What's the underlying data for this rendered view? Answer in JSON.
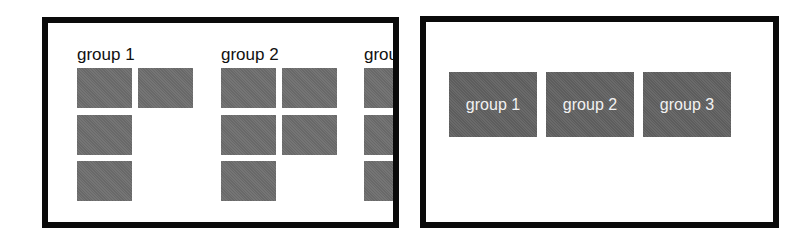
{
  "left_panel": {
    "description": "groups shown as grids of tiles (overflowing, third group clipped)",
    "groups": [
      {
        "label": "group 1",
        "tile_count": 4
      },
      {
        "label": "group 2",
        "tile_count": 5
      },
      {
        "label": "group 3",
        "tile_count": 3
      }
    ]
  },
  "right_panel": {
    "description": "groups collapsed into single labeled tiles",
    "tiles": [
      {
        "label": "group 1"
      },
      {
        "label": "group 2"
      },
      {
        "label": "group 3"
      }
    ]
  },
  "colors": {
    "border": "#0a0a0a",
    "tile": "#6e6e6e",
    "tile_text": "#f2f2f2"
  }
}
